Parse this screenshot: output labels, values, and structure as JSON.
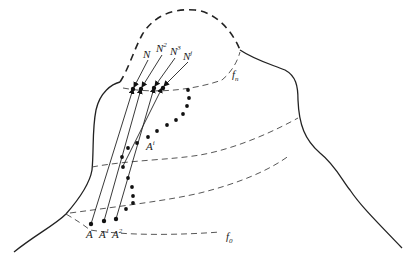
{
  "diagram": {
    "labels": {
      "level_top": "f",
      "level_top_sub": "n",
      "level_bottom": "f",
      "level_bottom_sub": "0",
      "N": "N",
      "N2_base": "N",
      "N2_sup": "2",
      "N3_base": "N",
      "N3_sup": "3",
      "Nj_base": "N",
      "Nj_sup": "j",
      "A": "A",
      "A1_base": "A",
      "A1_sup": "1",
      "A2_base": "A",
      "A2_sup": "2",
      "Ai_base": "A",
      "Ai_sup": "i"
    },
    "colors": {
      "line": "#222222",
      "background": "#ffffff"
    }
  }
}
